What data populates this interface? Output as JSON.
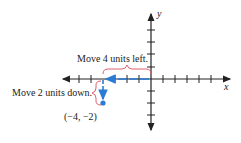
{
  "diagram": {
    "title": "",
    "labels": {
      "move_left": "Move 4 units left.",
      "move_down": "Move 2 units down.",
      "point": "(−4, −2)",
      "x_axis": "x",
      "y_axis": "y"
    },
    "point": {
      "x": -4,
      "y": -2
    },
    "colors": {
      "axes": "#222222",
      "path": "#2a7bd4",
      "brace": "#e0606e"
    },
    "axes": {
      "x_ticks_left": 7,
      "x_ticks_right": 6,
      "y_ticks_up": 4,
      "y_ticks_down": 3
    }
  }
}
